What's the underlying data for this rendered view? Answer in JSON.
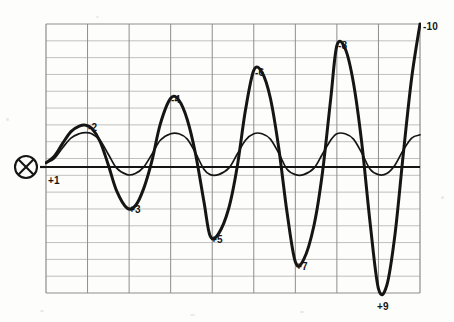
{
  "figure": {
    "kind": "oscilloscope-waveform-plot",
    "background_color": "#fdfdfb",
    "ink_color": "#151515",
    "grid_color": "#8d8d8d",
    "grid_minor_color": "#b9b9b9",
    "marker": {
      "name": "circled-x-marker",
      "glyph": "⊗",
      "x": 26,
      "y": 167
    },
    "plot_box": {
      "x": 46,
      "y": 24,
      "width": 374,
      "height": 269
    },
    "grid": {
      "columns": 9,
      "rows": 16
    },
    "baseline_y": 167,
    "lead_line": {
      "x1": 40,
      "x2": 46,
      "y": 167
    }
  },
  "labels": [
    {
      "text": "+1",
      "x": 48,
      "y": 176,
      "anchor": "start"
    },
    {
      "text": "-2",
      "x": 88,
      "y": 123,
      "anchor": "start"
    },
    {
      "text": "+3",
      "x": 129,
      "y": 205,
      "anchor": "start"
    },
    {
      "text": "-4",
      "x": 171,
      "y": 95,
      "anchor": "start"
    },
    {
      "text": "+5",
      "x": 211,
      "y": 235,
      "anchor": "start"
    },
    {
      "text": "-6",
      "x": 255,
      "y": 68,
      "anchor": "start"
    },
    {
      "text": "+7",
      "x": 296,
      "y": 262,
      "anchor": "start"
    },
    {
      "text": "-8",
      "x": 338,
      "y": 41,
      "anchor": "start"
    },
    {
      "text": "+9",
      "x": 377,
      "y": 302,
      "anchor": "start"
    },
    {
      "text": "-10",
      "x": 423,
      "y": 22,
      "anchor": "start"
    }
  ],
  "chart_data": {
    "type": "line",
    "title": "",
    "xlabel": "",
    "ylabel": "",
    "grid": true,
    "legend_position": "none",
    "xlim": [
      0,
      9
    ],
    "ylim": [
      -1.25,
      1.25
    ],
    "annotations": [
      {
        "label": "+1",
        "series": "growing-oscillation",
        "x": 0.05,
        "y": -0.07,
        "note": "start of trace at baseline"
      },
      {
        "label": "-2",
        "series": "growing-oscillation",
        "x": 0.95,
        "y": 0.31,
        "note": "1st positive peak"
      },
      {
        "label": "+3",
        "series": "growing-oscillation",
        "x": 1.95,
        "y": -0.46,
        "note": "1st negative trough"
      },
      {
        "label": "-4",
        "series": "growing-oscillation",
        "x": 3.0,
        "y": 0.56,
        "note": "2nd positive peak"
      },
      {
        "label": "+5",
        "series": "growing-oscillation",
        "x": 3.95,
        "y": -0.72,
        "note": "2nd negative trough"
      },
      {
        "label": "-6",
        "series": "growing-oscillation",
        "x": 5.0,
        "y": 0.82,
        "note": "3rd positive peak"
      },
      {
        "label": "+7",
        "series": "growing-oscillation",
        "x": 6.0,
        "y": -0.96,
        "note": "3rd negative trough"
      },
      {
        "label": "-8",
        "series": "growing-oscillation",
        "x": 7.0,
        "y": 1.05,
        "note": "4th positive peak"
      },
      {
        "label": "+9",
        "series": "growing-oscillation",
        "x": 8.0,
        "y": -1.21,
        "note": "4th negative trough, off lower grid"
      },
      {
        "label": "-10",
        "series": "growing-oscillation",
        "x": 9.0,
        "y": 1.25,
        "note": "trace exits top right of grid"
      }
    ],
    "series": [
      {
        "name": "growing-oscillation",
        "style": "thick",
        "color": "#151515",
        "description": "oscillation of exponentially increasing amplitude, alternating peaks and troughs, ending in a steep rise off the top-right corner",
        "x": [
          0.0,
          0.2,
          0.4,
          0.6,
          0.8,
          0.95,
          1.1,
          1.3,
          1.5,
          1.7,
          1.95,
          2.15,
          2.35,
          2.55,
          2.75,
          3.0,
          3.2,
          3.4,
          3.6,
          3.8,
          3.95,
          4.15,
          4.4,
          4.6,
          4.8,
          5.0,
          5.2,
          5.4,
          5.6,
          5.8,
          6.0,
          6.2,
          6.45,
          6.65,
          6.85,
          7.0,
          7.2,
          7.4,
          7.6,
          7.8,
          8.0,
          8.2,
          8.4,
          8.6,
          8.8,
          9.0
        ],
        "y": [
          -0.04,
          0.02,
          0.14,
          0.25,
          0.3,
          0.31,
          0.28,
          0.16,
          -0.06,
          -0.3,
          -0.46,
          -0.44,
          -0.28,
          -0.02,
          0.32,
          0.56,
          0.54,
          0.36,
          0.04,
          -0.4,
          -0.72,
          -0.7,
          -0.46,
          -0.08,
          0.45,
          0.82,
          0.8,
          0.56,
          0.1,
          -0.5,
          -0.96,
          -0.94,
          -0.62,
          -0.14,
          0.55,
          1.05,
          1.02,
          0.7,
          0.14,
          -0.6,
          -1.21,
          -1.18,
          -0.7,
          0.05,
          0.75,
          1.25
        ]
      },
      {
        "name": "steady-oscillation",
        "style": "thin",
        "color": "#151515",
        "description": "oscillation of nearly constant small amplitude following the same phase, with a slight rise at the right end",
        "x": [
          0.0,
          0.2,
          0.4,
          0.6,
          0.8,
          0.95,
          1.1,
          1.3,
          1.5,
          1.7,
          1.95,
          2.15,
          2.35,
          2.55,
          2.75,
          3.0,
          3.2,
          3.4,
          3.6,
          3.8,
          3.95,
          4.15,
          4.4,
          4.6,
          4.8,
          5.0,
          5.2,
          5.4,
          5.6,
          5.8,
          6.0,
          6.2,
          6.45,
          6.65,
          6.85,
          7.0,
          7.2,
          7.4,
          7.6,
          7.8,
          8.0,
          8.2,
          8.4,
          8.6,
          8.8,
          9.0
        ],
        "y": [
          -0.04,
          0.0,
          0.1,
          0.19,
          0.23,
          0.24,
          0.23,
          0.17,
          0.04,
          -0.09,
          -0.15,
          -0.14,
          -0.08,
          0.04,
          0.17,
          0.23,
          0.23,
          0.18,
          0.05,
          -0.1,
          -0.15,
          -0.15,
          -0.09,
          0.04,
          0.17,
          0.23,
          0.23,
          0.18,
          0.05,
          -0.1,
          -0.15,
          -0.15,
          -0.09,
          0.04,
          0.17,
          0.23,
          0.23,
          0.18,
          0.05,
          -0.1,
          -0.15,
          -0.14,
          -0.06,
          0.08,
          0.19,
          0.22
        ]
      }
    ]
  }
}
